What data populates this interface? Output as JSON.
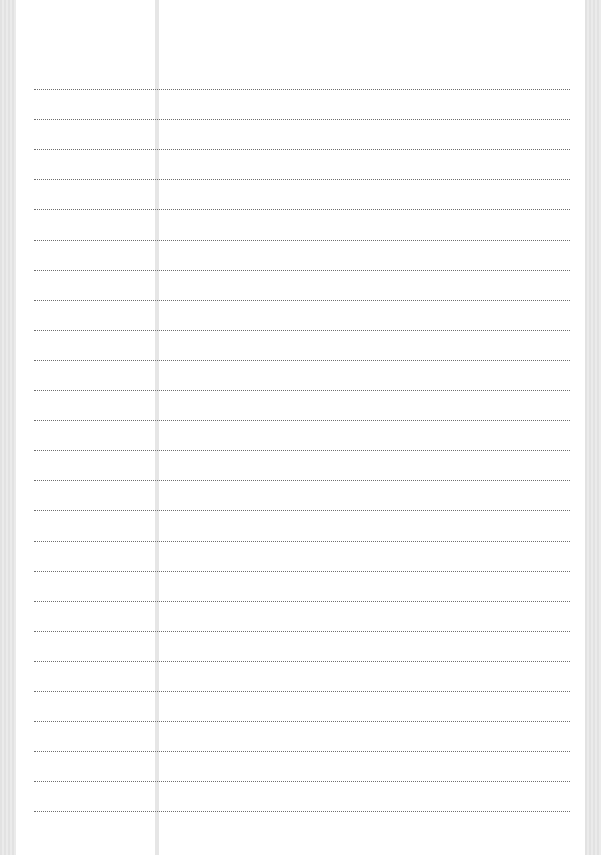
{
  "page": {
    "type": "lined-paper",
    "rule_style": "dotted",
    "rule_color": "#6f6f6f",
    "margin_line_color": "#e6e6e6",
    "edge_color": "#e2e2e2",
    "line_count": 25,
    "first_line_y": 89,
    "line_spacing": 30.1
  }
}
